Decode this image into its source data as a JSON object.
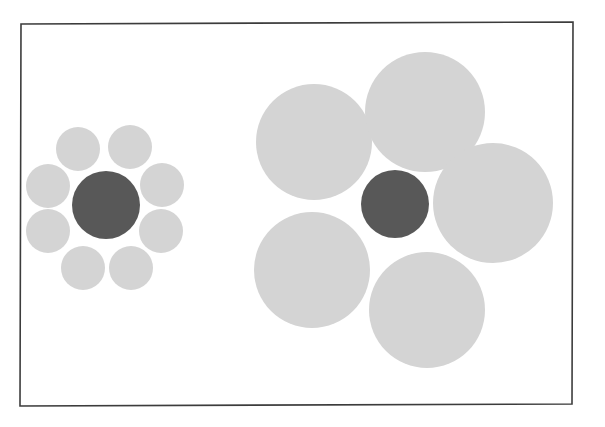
{
  "figure": {
    "title": "Ebbinghaus illusion",
    "background_color": "#ffffff",
    "canvas": {
      "width": 605,
      "height": 427
    },
    "frame": {
      "name": "figure-border",
      "x": 20.5,
      "y": 22.5,
      "width": 552,
      "height": 382,
      "stroke_color": "#3c3c3c",
      "stroke_width": 1.6,
      "fill": "none",
      "skew_note": "slightly rotated / hand-scanned frame"
    },
    "colors": {
      "target_circle": "#585858",
      "inducer_circle": "#d4d4d4",
      "frame_stroke": "#3c3c3c",
      "page_background": "#ffffff"
    },
    "clusters": [
      {
        "name": "left-cluster-small-inducers",
        "label": "Target surrounded by small circles",
        "target": {
          "name": "target-circle-left",
          "cx": 106,
          "cy": 205,
          "r": 34,
          "color": "#585858"
        },
        "inducers": [
          {
            "name": "inducer-left-1",
            "cx": 78,
            "cy": 149,
            "r": 22,
            "color": "#d4d4d4"
          },
          {
            "name": "inducer-left-2",
            "cx": 130,
            "cy": 147,
            "r": 22,
            "color": "#d4d4d4"
          },
          {
            "name": "inducer-left-3",
            "cx": 162,
            "cy": 185,
            "r": 22,
            "color": "#d4d4d4"
          },
          {
            "name": "inducer-left-4",
            "cx": 161,
            "cy": 231,
            "r": 22,
            "color": "#d4d4d4"
          },
          {
            "name": "inducer-left-5",
            "cx": 131,
            "cy": 268,
            "r": 22,
            "color": "#d4d4d4"
          },
          {
            "name": "inducer-left-6",
            "cx": 83,
            "cy": 268,
            "r": 22,
            "color": "#d4d4d4"
          },
          {
            "name": "inducer-left-7",
            "cx": 48,
            "cy": 231,
            "r": 22,
            "color": "#d4d4d4"
          },
          {
            "name": "inducer-left-8",
            "cx": 48,
            "cy": 186,
            "r": 22,
            "color": "#d4d4d4"
          }
        ]
      },
      {
        "name": "right-cluster-large-inducers",
        "label": "Target surrounded by large circles",
        "target": {
          "name": "target-circle-right",
          "cx": 395,
          "cy": 204,
          "r": 34,
          "color": "#585858"
        },
        "inducers": [
          {
            "name": "inducer-right-1",
            "cx": 314,
            "cy": 142,
            "r": 58,
            "color": "#d4d4d4"
          },
          {
            "name": "inducer-right-2",
            "cx": 425,
            "cy": 112,
            "r": 60,
            "color": "#d4d4d4"
          },
          {
            "name": "inducer-right-3",
            "cx": 493,
            "cy": 203,
            "r": 60,
            "color": "#d4d4d4"
          },
          {
            "name": "inducer-right-4",
            "cx": 427,
            "cy": 310,
            "r": 58,
            "color": "#d4d4d4"
          },
          {
            "name": "inducer-right-5",
            "cx": 312,
            "cy": 270,
            "r": 58,
            "color": "#d4d4d4"
          }
        ]
      }
    ]
  }
}
